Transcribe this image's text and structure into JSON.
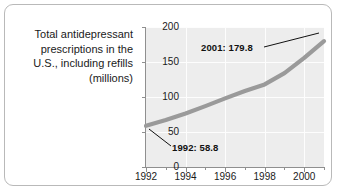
{
  "figure": {
    "caption_lines": [
      "Total antidepressant",
      "prescriptions in the",
      "U.S., including refills",
      "(millions)"
    ],
    "border_color": "#b9b9b9",
    "plot_bg_color": "#ededed",
    "grid_color": "#fdfdfd",
    "series_color": "#9a9a9a",
    "axis_color": "#8f8f8f"
  },
  "chart_data": {
    "type": "line",
    "title": "Total antidepressant prescriptions in the U.S., including refills (millions)",
    "xlabel": "",
    "ylabel": "millions",
    "xlim": [
      1992,
      2001
    ],
    "ylim": [
      0,
      200
    ],
    "xticks": [
      1992,
      1994,
      1996,
      1998,
      2000
    ],
    "xtick_labels": [
      "1992",
      "1994",
      "1996",
      "1998",
      "2000"
    ],
    "xminor_ticks": [
      1993,
      1995,
      1997,
      1999,
      2001
    ],
    "yticks": [
      0,
      50,
      100,
      150,
      200
    ],
    "ytick_labels": [
      "0",
      "50",
      "100",
      "150",
      "200"
    ],
    "grid": true,
    "legend": "none",
    "x": [
      1992,
      1993,
      1994,
      1995,
      1996,
      1997,
      1998,
      1999,
      2000,
      2001
    ],
    "values": [
      58.8,
      67.0,
      76.5,
      87.0,
      98.0,
      108.5,
      118.0,
      134.0,
      156.0,
      179.8
    ],
    "annotations": [
      {
        "label": "1992: 58.8",
        "x": 1992,
        "y": 58.8
      },
      {
        "label": "2001: 179.8",
        "x": 2001,
        "y": 179.8
      }
    ]
  }
}
